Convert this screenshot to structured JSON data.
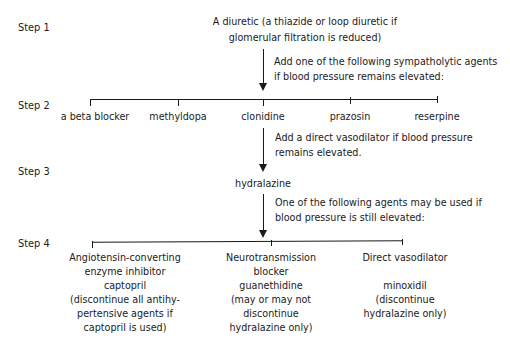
{
  "steps": [
    {
      "label": "Step 1"
    },
    {
      "label": "Step 2"
    },
    {
      "label": "Step 3"
    },
    {
      "label": "Step 4"
    }
  ],
  "step1": {
    "line1": "A diuretic (a thiazide or loop diuretic if",
    "line2": "glomerular filtration is reduced)"
  },
  "transition1": {
    "line1": "Add one of the following sympatholytic agents",
    "line2": "if blood pressure remains elevated:"
  },
  "step2": {
    "options": [
      {
        "label": "a beta blocker"
      },
      {
        "label": "methyldopa"
      },
      {
        "label": "clonidine"
      },
      {
        "label": "prazosin"
      },
      {
        "label": "reserpine"
      }
    ]
  },
  "transition2": {
    "line1": "Add a direct vasodilator if blood pressure",
    "line2": "remains elevated."
  },
  "step3": {
    "drug": "hydralazine"
  },
  "transition3": {
    "line1": "One of the following agents may be used if",
    "line2": "blood pressure is still elevated:"
  },
  "step4": {
    "options": [
      {
        "lines": [
          "Angiotensin-converting",
          "enzyme inhibitor",
          "captopril",
          "(discontinue all antihy-",
          "pertensive agents if",
          "captopril is used)"
        ]
      },
      {
        "lines": [
          "Neurotransmission",
          "blocker",
          "guanethidine",
          "(may or may not",
          "discontinue",
          "hydralazine only)"
        ]
      },
      {
        "lines": [
          "Direct vasodilator",
          "",
          "minoxidil",
          "(discontinue",
          "hydralazine only)"
        ]
      }
    ]
  }
}
